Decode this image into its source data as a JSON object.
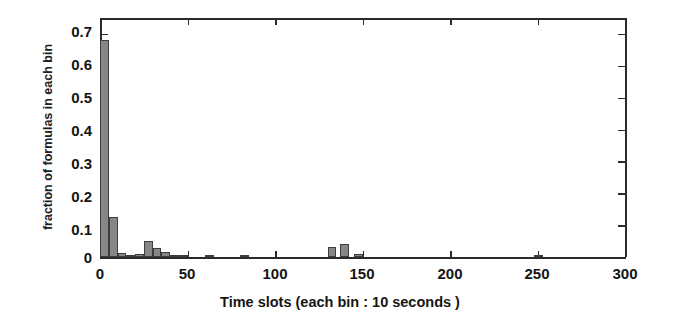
{
  "chart_data": {
    "type": "bar",
    "title": "",
    "xlabel": "Time slots (each bin : 10 seconds )",
    "ylabel": "fraction of formulas in each bin",
    "xlim": [
      0,
      300
    ],
    "ylim": [
      0,
      0.75
    ],
    "xticks": [
      0,
      50,
      100,
      150,
      200,
      250,
      300
    ],
    "xtick_labels": [
      "0",
      "50",
      "100",
      "150",
      "200",
      "250",
      "300"
    ],
    "yticks": [
      0,
      0.1,
      0.2,
      0.3,
      0.4,
      0.5,
      0.6,
      0.7
    ],
    "ytick_labels": [
      "0",
      "0.1",
      "0.2",
      "0.3",
      "0.4",
      "0.5",
      "0.6",
      "0.7"
    ],
    "grid": false,
    "legend": null,
    "bin_width": 5,
    "bar_color": "#878787",
    "bar_edge_color": "#3d3d3d",
    "bins": [
      {
        "x": 0,
        "value": 0.68
      },
      {
        "x": 5,
        "value": 0.125
      },
      {
        "x": 10,
        "value": 0.012
      },
      {
        "x": 15,
        "value": 0.004
      },
      {
        "x": 20,
        "value": 0.009
      },
      {
        "x": 25,
        "value": 0.05
      },
      {
        "x": 30,
        "value": 0.028
      },
      {
        "x": 35,
        "value": 0.017
      },
      {
        "x": 40,
        "value": 0.007
      },
      {
        "x": 45,
        "value": 0.003
      },
      {
        "x": 60,
        "value": 0.006
      },
      {
        "x": 80,
        "value": 0.002
      },
      {
        "x": 130,
        "value": 0.032
      },
      {
        "x": 137,
        "value": 0.04
      },
      {
        "x": 145,
        "value": 0.008
      },
      {
        "x": 248,
        "value": 0.006
      }
    ]
  }
}
